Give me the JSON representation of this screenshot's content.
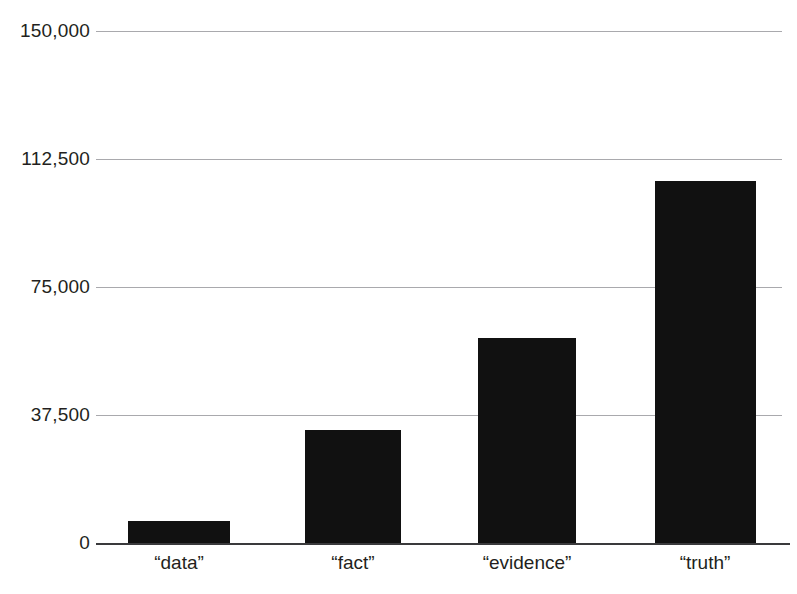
{
  "chart_data": {
    "type": "bar",
    "title": "",
    "subtitle": "",
    "xlabel": "",
    "ylabel": "",
    "categories": [
      "“data”",
      "“fact”",
      "“evidence”",
      "“truth”"
    ],
    "values": [
      6400,
      33000,
      60000,
      106000
    ],
    "ylim": [
      0,
      150000
    ],
    "yticks": [
      0,
      37500,
      75000,
      112500,
      150000
    ],
    "ytick_labels": [
      "0",
      "37,500",
      "75,000",
      "112,500",
      "150,000"
    ],
    "grid": true,
    "legend": false,
    "legend_position": "none",
    "orientation": "vertical",
    "bar_color": "#111111",
    "gridline_color": "#a9a9ad",
    "axis_color": "#3a3a3c",
    "text_color": "#231f20",
    "background_color": "#ffffff"
  },
  "axis": {
    "y": {
      "ticks": [
        {
          "label": "150,000",
          "value": 150000
        },
        {
          "label": "112,500",
          "value": 112500
        },
        {
          "label": "75,000",
          "value": 75000
        },
        {
          "label": "37,500",
          "value": 37500
        },
        {
          "label": "0",
          "value": 0
        }
      ]
    },
    "x": {
      "ticks": [
        {
          "label": "“data”"
        },
        {
          "label": "“fact”"
        },
        {
          "label": "“evidence”"
        },
        {
          "label": "“truth”"
        }
      ]
    }
  }
}
